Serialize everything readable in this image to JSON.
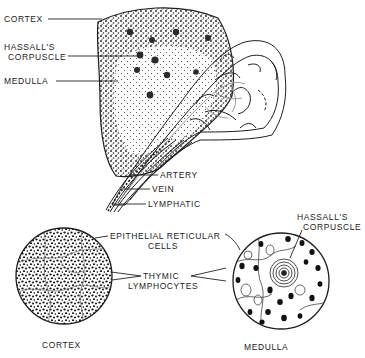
{
  "figure": {
    "colors": {
      "ink": "#1e1e1e",
      "background": "#ffffff",
      "gray_vessel": "#9a9a9a"
    },
    "gross_view": {
      "labels": {
        "cortex": "CORTEX",
        "hassalls_corpuscle_line1": "HASSALL'S",
        "hassalls_corpuscle_line2": "CORPUSCLE",
        "medulla": "MEDULLA",
        "artery": "ARTERY",
        "vein": "VEIN",
        "lymphatic": "LYMPHATIC"
      }
    },
    "micro_views": {
      "epithelial_line1": "EPITHELIAL  RETICULAR",
      "epithelial_line2": "CELLS",
      "thymic_line1": "THYMIC",
      "thymic_line2": "LYMPHOCYTES",
      "hassalls_line1": "HASSALL'S",
      "hassalls_line2": "CORPUSCLE",
      "cortex_caption": "CORTEX",
      "medulla_caption": "MEDULLA"
    }
  }
}
